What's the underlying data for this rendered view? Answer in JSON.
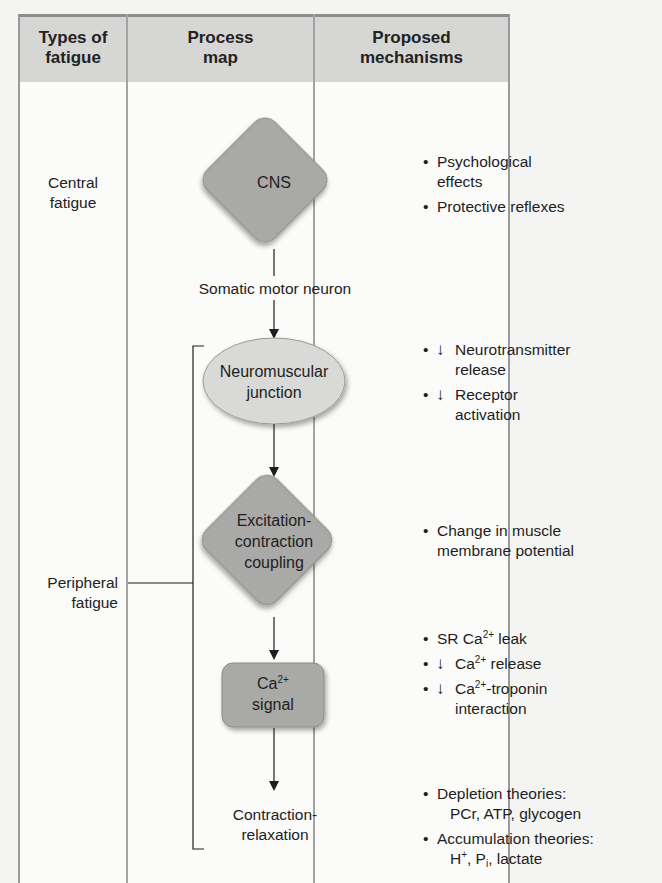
{
  "headers": {
    "types": [
      "Types of",
      "fatigue"
    ],
    "process": [
      "Process",
      "map"
    ],
    "mechanisms": [
      "Proposed",
      "mechanisms"
    ]
  },
  "types_of_fatigue": {
    "central": [
      "Central",
      "fatigue"
    ],
    "peripheral": [
      "Peripheral",
      "fatigue"
    ]
  },
  "process_map": {
    "cns": "CNS",
    "somatic_motor_neuron": "Somatic motor neuron",
    "nmj": [
      "Neuromuscular",
      "junction"
    ],
    "ec_coupling": [
      "Excitation-",
      "contraction",
      "coupling"
    ],
    "ca_signal": {
      "base": "Ca",
      "sup": "2+",
      "line2": "signal"
    },
    "contraction_relaxation": [
      "Contraction-",
      "relaxation"
    ]
  },
  "mechanisms": {
    "central": [
      {
        "text": [
          "Psychological",
          "effects"
        ],
        "arrow": false
      },
      {
        "text": [
          "Protective reflexes"
        ],
        "arrow": false
      }
    ],
    "nmj": [
      {
        "text": [
          "Neurotransmitter",
          "release"
        ],
        "arrow": true
      },
      {
        "text": [
          "Receptor",
          "activation"
        ],
        "arrow": true
      }
    ],
    "ec_coupling": [
      {
        "text": [
          "Change in muscle",
          "membrane potential"
        ],
        "arrow": false
      }
    ],
    "ca_signal": [
      {
        "pre": "SR Ca",
        "sup": "2+",
        "post": " leak",
        "arrow": false
      },
      {
        "pre": "Ca",
        "sup": "2+",
        "post": " release",
        "arrow": true
      },
      {
        "pre": "Ca",
        "sup": "2+",
        "post": "-troponin",
        "line2": "interaction",
        "arrow": true
      }
    ],
    "metabolic": [
      {
        "text": [
          "Depletion theories:",
          "PCr, ATP, glycogen"
        ],
        "arrow": false
      },
      {
        "line1": "Accumulation theories:",
        "h": "H",
        "h_sup": "+",
        "p": "P",
        "p_sub": "i",
        "rest": ", lactate",
        "arrow": false
      }
    ],
    "down_arrow_glyph": "↓"
  },
  "colors": {
    "header_bg": "#d6d6d4",
    "node_fill": "#a9a9a7",
    "nmj_fill": "#d9d9d7",
    "border": "#9a9a9a"
  }
}
